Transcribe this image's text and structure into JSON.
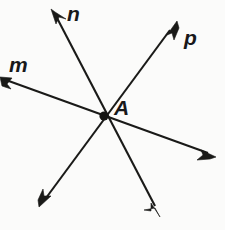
{
  "figure": {
    "background_color": "#fbfbfa",
    "ink_color": "#1a1a18",
    "width": 225,
    "height": 230
  },
  "point": {
    "label": "A",
    "x": 104,
    "y": 116,
    "dot_radius": 4.6
  },
  "lines": [
    {
      "id": "m",
      "label": "m",
      "label_x": 9,
      "label_y": 54,
      "x1": 0,
      "y1": 78,
      "x2": 216,
      "y2": 156,
      "arrow_start": true,
      "arrow_end": true
    },
    {
      "id": "n",
      "label": "n",
      "label_x": 67,
      "label_y": 3,
      "x1": 52,
      "y1": 10,
      "x2": 160,
      "y2": 216,
      "arrow_start": true,
      "arrow_end": true
    },
    {
      "id": "p",
      "label": "p",
      "label_x": 184,
      "label_y": 27,
      "x1": 176,
      "y1": 22,
      "x2": 40,
      "y2": 206,
      "arrow_start": true,
      "arrow_end": true
    }
  ],
  "labels": {
    "m": "m",
    "n": "n",
    "p": "p",
    "A": "A"
  }
}
